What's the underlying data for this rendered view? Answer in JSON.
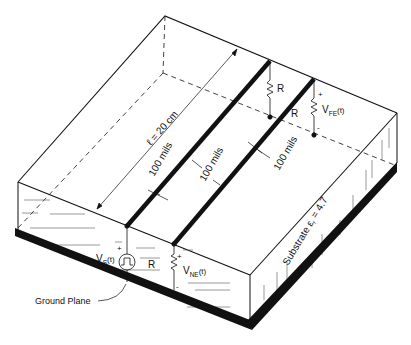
{
  "diagram": {
    "labels": {
      "length": "ℓ = 20 cm",
      "spacing_1": "100 mils",
      "spacing_2": "100 mils",
      "spacing_3": "100 mils",
      "source_v": "V",
      "source_sub": "S",
      "source_t": "(t)",
      "source_plus": "+",
      "ne_v": "V",
      "ne_sub": "NE",
      "ne_t": "(t)",
      "ne_plus": "+",
      "ne_minus": "-",
      "fe_v": "V",
      "fe_sub": "FE",
      "fe_t": "(t)",
      "fe_plus": "+",
      "fe_minus": "-",
      "resistor_near": "R",
      "resistor_far_1": "R",
      "resistor_far_2": "R",
      "ground_plane": "Ground Plane",
      "substrate": "Substrate ε",
      "substrate_sub": "r",
      "substrate_value": " = 4.7"
    },
    "colors": {
      "ink": "#111111",
      "background": "#ffffff",
      "hatch": "#555555"
    }
  }
}
